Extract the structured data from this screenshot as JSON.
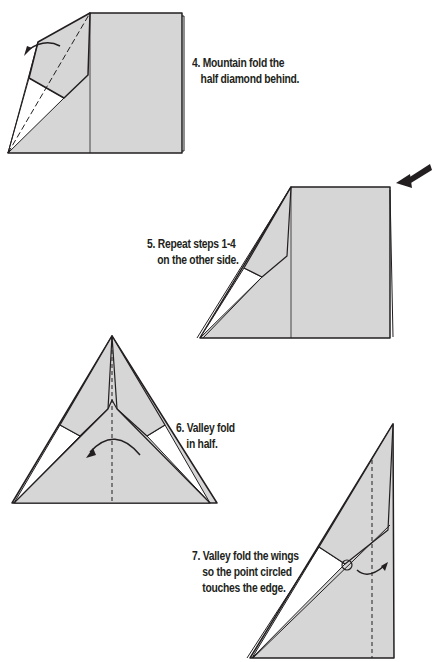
{
  "colors": {
    "paper": "#d6d6d6",
    "line": "#231f20",
    "background": "#ffffff"
  },
  "steps": [
    {
      "number": 4,
      "lines": [
        "4. Mountain fold the",
        "half diamond behind."
      ]
    },
    {
      "number": 5,
      "lines": [
        "5. Repeat steps 1-4",
        "on the other side."
      ]
    },
    {
      "number": 6,
      "lines": [
        "6. Valley fold",
        "in half."
      ]
    },
    {
      "number": 7,
      "lines": [
        "7. Valley fold the wings",
        "so the point circled",
        "touches the edge."
      ]
    }
  ]
}
